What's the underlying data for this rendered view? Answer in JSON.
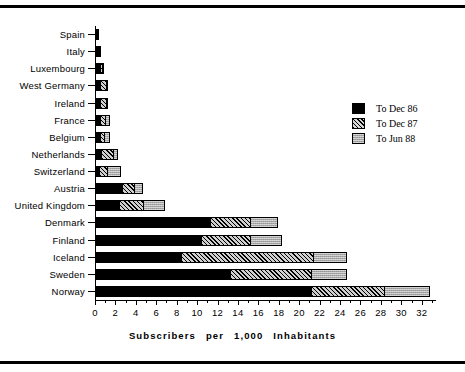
{
  "chart_data": {
    "type": "bar",
    "orientation": "horizontal",
    "stacked": true,
    "title": "",
    "xlabel": "Subscribers  per  1,000  Inhabitants",
    "ylabel": "",
    "xlim": [
      0,
      33.3
    ],
    "grid": false,
    "legend_position": "right",
    "categories": [
      "Spain",
      "Italy",
      "Luxembourg",
      "West Germany",
      "Ireland",
      "France",
      "Belgium",
      "Netherlands",
      "Switzerland",
      "Austria",
      "United Kingdom",
      "Denmark",
      "Finland",
      "Iceland",
      "Sweden",
      "Norway"
    ],
    "series": [
      {
        "name": "To Dec 86",
        "values": [
          0.15,
          0.2,
          0.35,
          0.4,
          0.35,
          0.4,
          0.35,
          0.5,
          0.3,
          2.5,
          2.3,
          11.2,
          10.3,
          8.3,
          13.1,
          21.1
        ]
      },
      {
        "name": "To Dec 87",
        "values": [
          0.0,
          0.1,
          0.2,
          0.6,
          0.6,
          0.5,
          0.4,
          1.2,
          0.8,
          1.2,
          2.3,
          3.9,
          4.8,
          13.0,
          8.0,
          7.1
        ]
      },
      {
        "name": "To Jun 88",
        "values": [
          0.0,
          0.05,
          0.05,
          0.1,
          0.1,
          0.4,
          0.5,
          0.4,
          1.3,
          0.8,
          2.1,
          2.6,
          3.0,
          3.2,
          3.4,
          4.4
        ]
      }
    ],
    "totals": [
      0.15,
      0.35,
      0.6,
      1.1,
      1.05,
      1.3,
      1.25,
      2.1,
      2.4,
      4.5,
      6.7,
      17.7,
      18.1,
      24.5,
      24.5,
      32.6
    ],
    "xticks": [
      0,
      2,
      4,
      6,
      8,
      10,
      12,
      14,
      16,
      18,
      20,
      22,
      24,
      26,
      28,
      30,
      32
    ],
    "xtick_labels": [
      "0",
      "2",
      "4",
      "6",
      "8",
      "10",
      "12",
      "14",
      "16",
      "18",
      "20",
      "22",
      "24",
      "26",
      "28",
      "30",
      "32"
    ],
    "xtick_minor_step": 1,
    "colors": {
      "to_dec_86": "#000000",
      "to_dec_87": "#000000",
      "to_jun_88": "#a8a8a8",
      "axis": "#000000",
      "background": "#ffffff"
    }
  },
  "legend": {
    "entries": [
      {
        "label": "To Dec 86",
        "pattern": "solid-black"
      },
      {
        "label": "To Dec 87",
        "pattern": "diagonal-hatch"
      },
      {
        "label": "To Jun 88",
        "pattern": "gray-stipple"
      }
    ]
  },
  "axis_title_words": [
    "Subscribers",
    "per",
    "1,000",
    "Inhabitants"
  ]
}
